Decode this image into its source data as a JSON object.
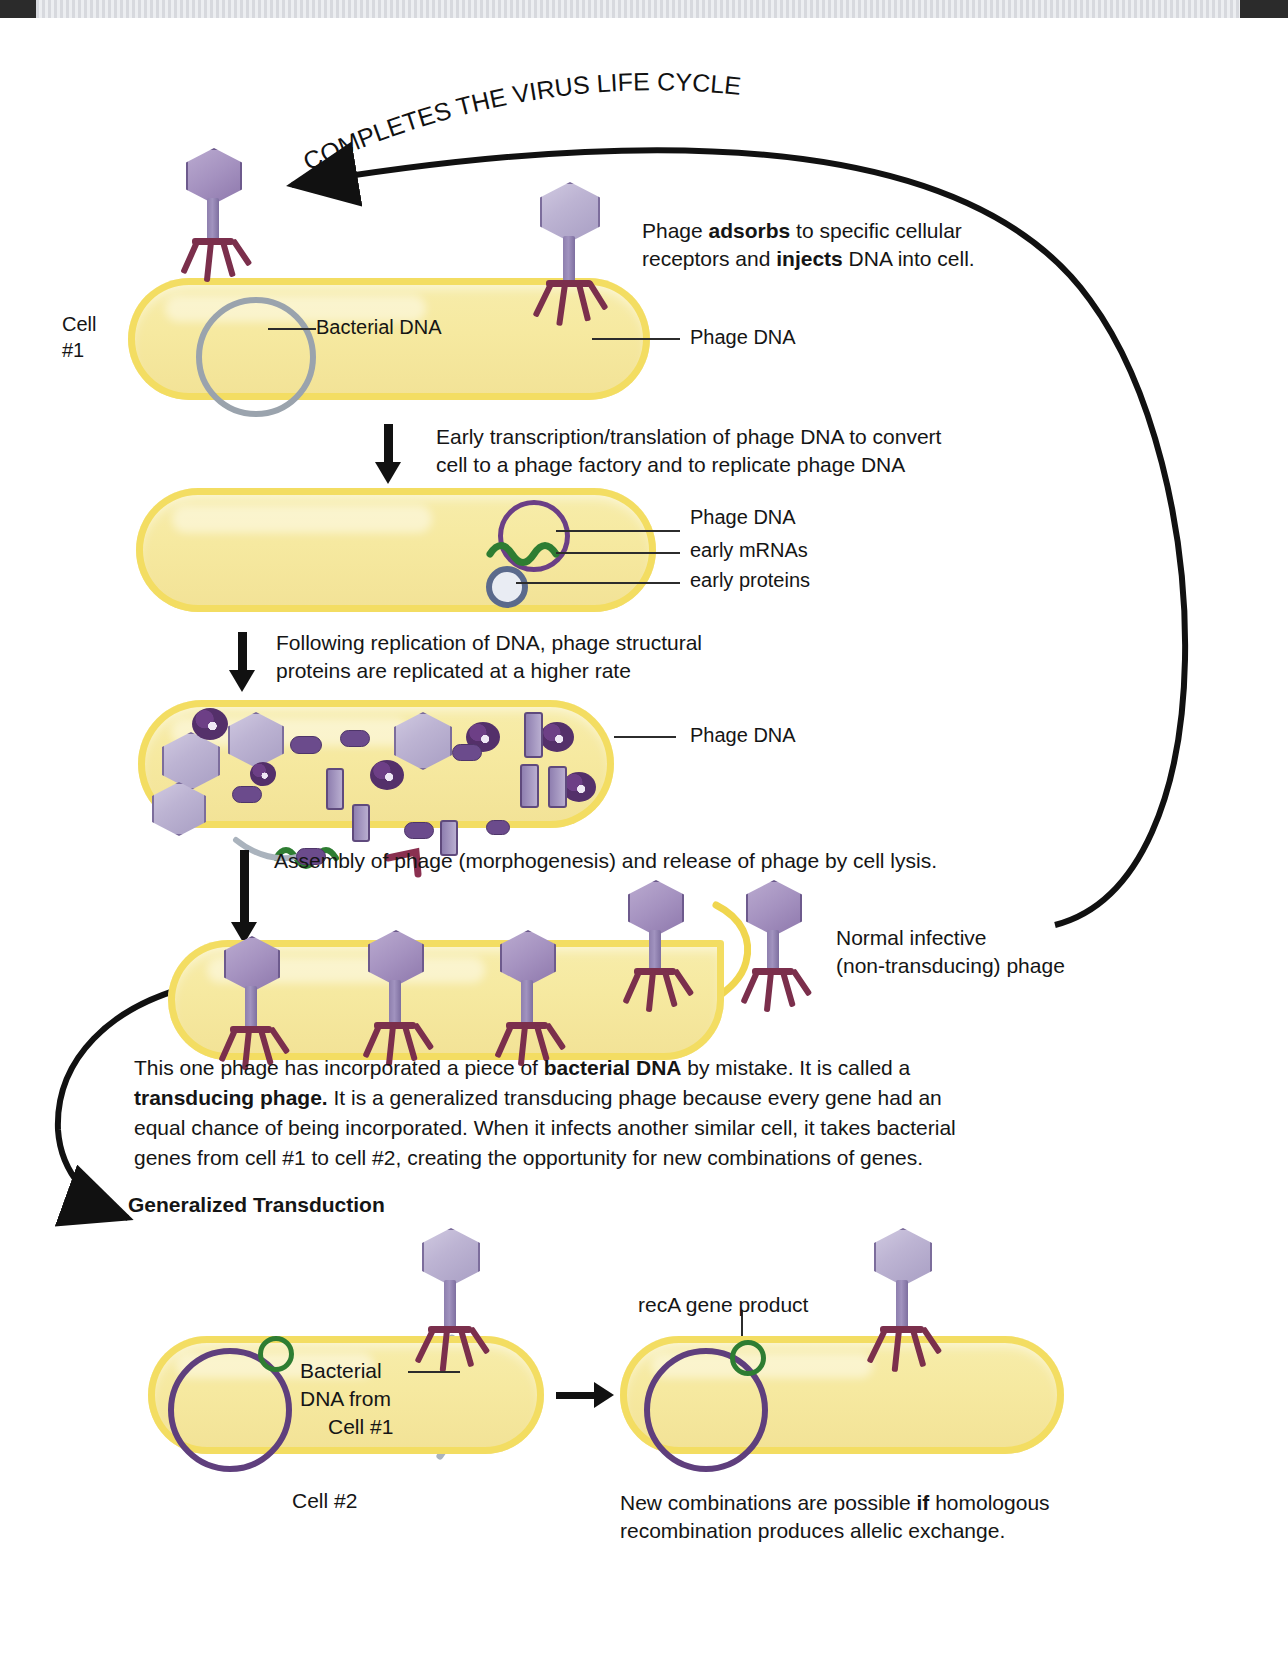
{
  "title_arc": "COMPLETES THE VIRUS LIFE CYCLE",
  "labels": {
    "cell1_line1": "Cell",
    "cell1_line2": "#1",
    "bacterial_dna": "Bacterial DNA",
    "phage_dna": "Phage DNA",
    "phage_dna_2": "Phage DNA",
    "phage_dna_3": "Phage DNA",
    "early_mrnas": "early mRNAs",
    "early_proteins": "early proteins",
    "normal_phage_line1": "Normal infective",
    "normal_phage_line2": "(non-transducing) phage",
    "reca": "recA gene product",
    "cell2": "Cell #2",
    "bacterial_dna_from_line1": "Bacterial",
    "bacterial_dna_from_line2": "DNA from",
    "bacterial_dna_from_line3": "Cell #1"
  },
  "steps": {
    "adsorb_line1_a": "Phage ",
    "adsorb_line1_b": "adsorbs",
    "adsorb_line1_c": " to specific cellular",
    "adsorb_line2_a": "receptors and ",
    "adsorb_line2_b": "injects",
    "adsorb_line2_c": " DNA into cell.",
    "early_line1": "Early transcription/translation of phage DNA to convert",
    "early_line2": "cell to a phage factory and to replicate phage DNA",
    "structural_line1": "Following replication of DNA, phage structural",
    "structural_line2": "proteins are replicated at a higher rate",
    "assembly": "Assembly of phage (morphogenesis) and release of phage by cell lysis."
  },
  "paragraph": {
    "l1_a": "This one phage has incorporated a piece of ",
    "l1_b": "bacterial DNA",
    "l1_c": " by mistake. It is called a",
    "l2_a": "transducing phage.",
    "l2_b": " It is a generalized transducing phage because every gene had an",
    "l3": "equal chance of being incorporated. When it infects another similar cell, it takes bacterial",
    "l4": "genes from cell #1 to cell #2, creating the opportunity for new combinations of genes."
  },
  "section_heading": "Generalized Transduction",
  "footer": {
    "l1_a": "New combinations are possible ",
    "l1_b": "if",
    "l1_c": " homologous",
    "l2": "recombination produces allelic exchange."
  },
  "colors": {
    "cell_fill": "#f5e79e",
    "cell_border": "#f3dd62",
    "phage_head": "#bdb4d3",
    "phage_tail_fiber": "#7b2f4c",
    "phage_dna_ring": "#6b3f86",
    "bacterial_dna_ring": "#9aa3ad",
    "mrna_green": "#2e7d32",
    "reca_green": "#2e7d32",
    "chromosome_purple": "#5f3f7d",
    "ink": "#151515"
  }
}
